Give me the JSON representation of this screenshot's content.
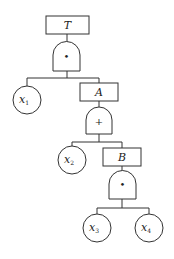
{
  "diagram": {
    "type": "fault-tree",
    "events": {
      "top": {
        "label": "T"
      },
      "a": {
        "label": "A"
      },
      "b": {
        "label": "B"
      }
    },
    "gates": {
      "g1": {
        "type": "AND",
        "symbol": "•",
        "parent": "T",
        "children": [
          "x1",
          "A"
        ]
      },
      "g2": {
        "type": "OR",
        "symbol": "+",
        "parent": "A",
        "children": [
          "x2",
          "B"
        ]
      },
      "g3": {
        "type": "AND",
        "symbol": "•",
        "parent": "B",
        "children": [
          "x3",
          "x4"
        ]
      }
    },
    "basic_events": [
      {
        "var": "x",
        "sub": "1"
      },
      {
        "var": "x",
        "sub": "2"
      },
      {
        "var": "x",
        "sub": "3"
      },
      {
        "var": "x",
        "sub": "4"
      }
    ]
  }
}
